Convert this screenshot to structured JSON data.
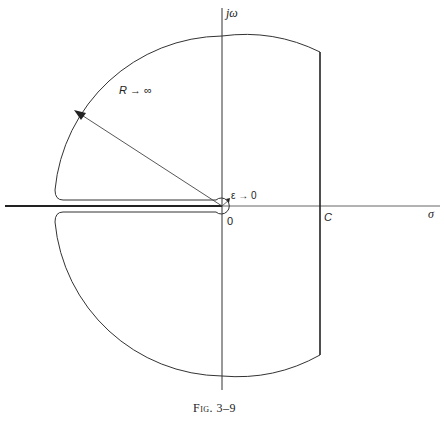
{
  "figure": {
    "caption": "Fig. 3–9",
    "axes": {
      "imag_label": "jω",
      "real_label": "σ",
      "origin_label": "0"
    },
    "contour": {
      "line_label": "C",
      "radius_label": "R → ∞",
      "epsilon_label": "ε → 0"
    },
    "colors": {
      "stroke": "#333333",
      "background": "#ffffff"
    }
  }
}
